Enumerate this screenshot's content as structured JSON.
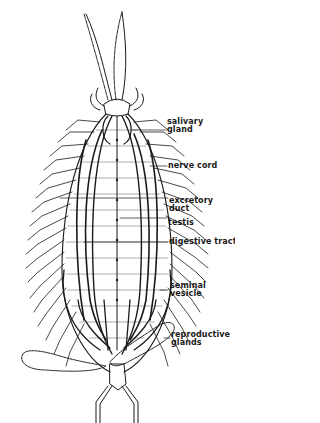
{
  "figure": {
    "colors": {
      "ink": "#1a1a1a",
      "background": "#ffffff"
    },
    "labels": [
      {
        "id": "salivary-gland",
        "line1": "salivary",
        "line2": "gland"
      },
      {
        "id": "nerve-cord",
        "line1": "nerve cord",
        "line2": ""
      },
      {
        "id": "excretory-duct",
        "line1": "excretory",
        "line2": "duct"
      },
      {
        "id": "testis",
        "line1": "testis",
        "line2": ""
      },
      {
        "id": "digestive-tract",
        "line1": "digestive tract",
        "line2": ""
      },
      {
        "id": "seminal-vesicle",
        "line1": "seminal",
        "line2": "vesicle"
      },
      {
        "id": "reproductive-glands",
        "line1": "reproductive",
        "line2": "glands"
      }
    ]
  }
}
